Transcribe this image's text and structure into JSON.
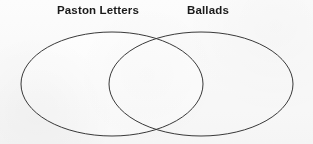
{
  "figure": {
    "type": "venn-diagram",
    "set_count": 2,
    "background_color": "#fcfcfc",
    "stroke_color": "#3a3a3a",
    "fill_color": "#ffffff",
    "stroke_width": 1
  },
  "labels": {
    "left": "Paston Letters",
    "right": "Ballads"
  },
  "sets": [
    {
      "name": "Paston Letters",
      "shape": "ellipse",
      "center_x": 112,
      "center_y": 84,
      "radius_x": 91,
      "radius_y": 52
    },
    {
      "name": "Ballads",
      "shape": "ellipse",
      "center_x": 201,
      "center_y": 84,
      "radius_x": 92,
      "radius_y": 52
    }
  ],
  "regions": {
    "left_only": "",
    "overlap": "",
    "right_only": ""
  }
}
